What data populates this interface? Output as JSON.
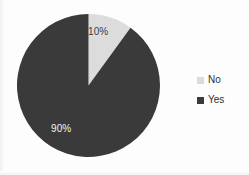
{
  "chart_data": {
    "type": "pie",
    "title": "",
    "subtitle": "",
    "xlabel": "",
    "ylabel": "",
    "grid": false,
    "legend_position": "right",
    "start_angle_deg": 0,
    "direction": "clockwise",
    "categories": [
      "No",
      "Yes"
    ],
    "values": [
      10,
      90
    ],
    "value_unit": "percent",
    "data_labels": [
      "10%",
      "90%"
    ],
    "colors": [
      "#dcdcdc",
      "#3a3a3a"
    ],
    "slices": [
      {
        "name": "No",
        "value": 10,
        "label": "10%",
        "color": "#dcdcdc",
        "label_color": "#3d3d3d"
      },
      {
        "name": "Yes",
        "value": 90,
        "label": "90%",
        "color": "#3a3a3a",
        "label_color": "#f2f2f2"
      }
    ]
  },
  "legend": {
    "items": [
      {
        "label": "No",
        "color": "#dcdcdc"
      },
      {
        "label": "Yes",
        "color": "#3a3a3a"
      }
    ]
  },
  "colors": {
    "background": "#fdfdfd",
    "slice_no": "#dcdcdc",
    "slice_yes": "#3a3a3a",
    "legend_text": "#2e2e2e"
  }
}
